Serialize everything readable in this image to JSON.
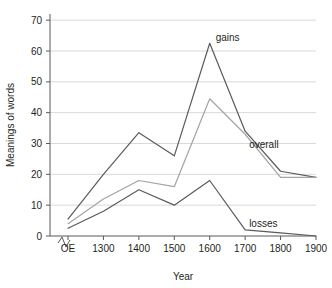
{
  "chart_data": {
    "type": "line",
    "title": "",
    "xlabel": "Year",
    "ylabel": "Meanings of words",
    "categories": [
      "OE",
      "1300",
      "1400",
      "1500",
      "1600",
      "1700",
      "1800",
      "1900"
    ],
    "x_tick_labels": [
      "OE",
      "1300",
      "1400",
      "1500",
      "1600",
      "1700",
      "1800",
      "1900"
    ],
    "y_tick_labels": [
      "0",
      "10",
      "20",
      "30",
      "40",
      "50",
      "60",
      "70"
    ],
    "y_ticks": [
      0,
      10,
      20,
      30,
      40,
      50,
      60,
      70
    ],
    "ylim": [
      0,
      72
    ],
    "grid": "horizontal",
    "legend": "inline-labels",
    "axis_break": "x-axis break between OE and 1300",
    "series": [
      {
        "name": "gains",
        "label": "gains",
        "color": "#5a5a5f",
        "values": [
          5.5,
          20,
          33.5,
          26,
          62.5,
          34,
          21,
          19
        ]
      },
      {
        "name": "overall",
        "label": "overall",
        "color": "#a3a3a8",
        "values": [
          4,
          12,
          18,
          16,
          44.5,
          33,
          19,
          19
        ]
      },
      {
        "name": "losses",
        "label": "losses",
        "color": "#5a5a5f",
        "values": [
          2.5,
          8,
          15,
          10,
          18,
          2,
          1,
          0
        ]
      }
    ],
    "annotations": [
      {
        "text": "gains",
        "series": "gains",
        "at_x": "1600"
      },
      {
        "text": "overall",
        "series": "overall",
        "at_x": "1700"
      },
      {
        "text": "losses",
        "series": "losses",
        "at_x": "1700"
      }
    ]
  }
}
